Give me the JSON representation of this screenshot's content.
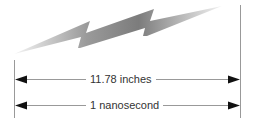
{
  "diagram": {
    "type": "dimension-illustration",
    "measurements": [
      {
        "label": "11.78 inches"
      },
      {
        "label": "1 nanosecond"
      }
    ],
    "colors": {
      "bolt_dark": "#7a7a7a",
      "bolt_light": "#e8e8e8",
      "lines": "#999999",
      "arrowheads": "#111111",
      "text": "#333333"
    }
  }
}
